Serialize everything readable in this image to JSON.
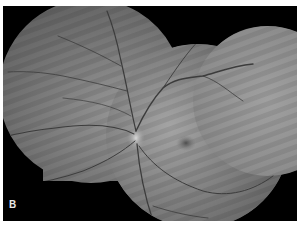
{
  "figure": {
    "panel_label": "B",
    "colors": {
      "background": "#000000",
      "border": "#ffffff",
      "fundus_gray": "#8a8a8a",
      "vessel": "#3a3a3a",
      "optic_disc": "#c8c8c8",
      "macula": "#5e5e5e",
      "label": "#e8e8e8"
    }
  }
}
